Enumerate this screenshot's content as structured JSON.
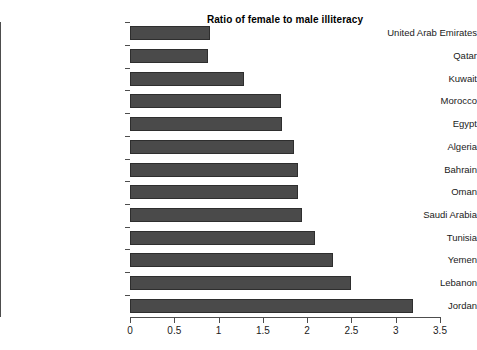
{
  "chart_data": {
    "type": "bar",
    "orientation": "horizontal",
    "title": "Ratio of female to male illiteracy",
    "xlabel": "",
    "ylabel": "",
    "xlim": [
      0,
      3.5
    ],
    "grid": false,
    "legend": false,
    "bar_color": "#4a4a4a",
    "bar_edge_color": "#2e2e2e",
    "background_color": "#ffffff",
    "axis_color": "#4d4d4d",
    "xticks": [
      "0",
      "0.5",
      "1",
      "1.5",
      "2",
      "2.5",
      "3",
      "3.5"
    ],
    "xtick_values": [
      0,
      0.5,
      1,
      1.5,
      2,
      2.5,
      3,
      3.5
    ],
    "categories": [
      "United Arab Emirates",
      "Qatar",
      "Kuwait",
      "Morocco",
      "Egypt",
      "Algeria",
      "Bahrain",
      "Oman",
      "Saudi Arabia",
      "Tunisia",
      "Yemen",
      "Lebanon",
      "Jordan"
    ],
    "values": [
      0.9,
      0.88,
      1.29,
      1.7,
      1.72,
      1.85,
      1.9,
      1.9,
      1.94,
      2.09,
      2.29,
      2.5,
      3.2
    ]
  }
}
